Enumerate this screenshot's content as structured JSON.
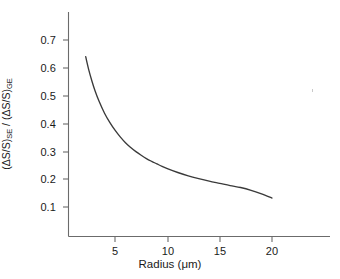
{
  "chart_data": {
    "type": "line",
    "title": "",
    "subtitle": "",
    "xlabel": "Radius (μm)",
    "ylabel_full": "(ΔS/S)SE / (ΔS/S)GE",
    "ylabel_parts": {
      "numerator": "(ΔS/S)",
      "numerator_sub": "SE",
      "separator": " / ",
      "denominator": "(ΔS/S)",
      "denominator_sub": "GE"
    },
    "xlim": [
      0,
      23.5
    ],
    "ylim": [
      0,
      0.78
    ],
    "xticks": [
      5,
      10,
      15,
      20
    ],
    "xtick_labels": [
      "5",
      "10",
      "15",
      "20"
    ],
    "yticks": [
      0.1,
      0.2,
      0.3,
      0.4,
      0.5,
      0.6,
      0.7
    ],
    "ytick_labels": [
      "0.1",
      "0.2",
      "0.3",
      "0.4",
      "0.5",
      "0.6",
      "0.7"
    ],
    "grid": false,
    "legend": null,
    "legend_position": "none",
    "spines": [
      "left",
      "bottom"
    ],
    "tick_direction": "out",
    "series": [
      {
        "name": "SE/GE signal ratio",
        "color": "#3a3a3a",
        "x": [
          2.2,
          2.5,
          2.8,
          3.1,
          3.5,
          4.0,
          4.5,
          5.0,
          5.5,
          6.0,
          6.5,
          7.0,
          7.5,
          8.0,
          8.5,
          9.0,
          9.5,
          10.0,
          11.0,
          12.0,
          13.0,
          14.0,
          15.0,
          16.0,
          17.0,
          18.0,
          19.0,
          20.0
        ],
        "y": [
          0.64,
          0.592,
          0.552,
          0.517,
          0.478,
          0.437,
          0.404,
          0.376,
          0.352,
          0.331,
          0.314,
          0.299,
          0.286,
          0.274,
          0.264,
          0.255,
          0.246,
          0.238,
          0.224,
          0.212,
          0.202,
          0.193,
          0.185,
          0.177,
          0.17,
          0.16,
          0.147,
          0.132
        ]
      }
    ],
    "annotations": []
  },
  "axis_titles": {
    "x": "Radius (μm)"
  }
}
